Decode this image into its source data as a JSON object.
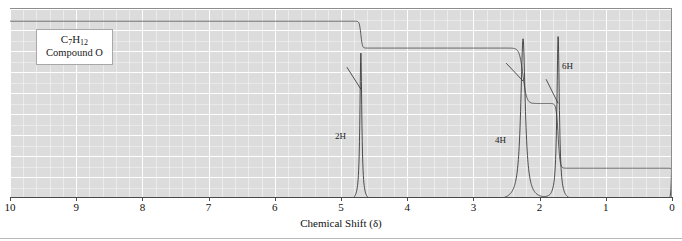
{
  "figure": {
    "type": "nmr-spectrum",
    "compound_label": {
      "formula_prefix": "C",
      "formula_sub1": "7",
      "formula_mid": "H",
      "formula_sub2": "12",
      "formula_plain": "C7H12",
      "name": "Compound O"
    },
    "axis": {
      "title": "Chemical Shift (δ)",
      "unit": "ppm",
      "ticks": [
        "10",
        "9",
        "8",
        "7",
        "6",
        "5",
        "4",
        "3",
        "2",
        "1",
        "0"
      ],
      "min_ppm": 0,
      "max_ppm": 10,
      "direction": "right-to-left",
      "minor_per_major": 5
    },
    "annotations": [
      {
        "label": "2H",
        "ppm": 4.7
      },
      {
        "label": "4H",
        "ppm": 2.25
      },
      {
        "label": "6H",
        "ppm": 1.72
      }
    ],
    "colors": {
      "plot_background": "#dcdcdc",
      "gridline": "#ffffff",
      "trace": "#3a3a3a",
      "axis": "#4a4a4a",
      "page_background": "#ffffff"
    }
  },
  "chart_data": {
    "type": "line",
    "title": "",
    "xlabel": "Chemical Shift (δ)",
    "ylabel": "",
    "xlim": [
      10,
      0
    ],
    "ylim": [
      0,
      1
    ],
    "grid": true,
    "legend": "none",
    "series": [
      {
        "name": "spectrum",
        "peaks": [
          {
            "ppm": 4.7,
            "height": 0.84,
            "width": 0.035,
            "label": "2H",
            "protons": 2
          },
          {
            "ppm": 2.25,
            "height": 0.92,
            "width": 0.085,
            "label": "4H",
            "protons": 4
          },
          {
            "ppm": 1.72,
            "height": 0.93,
            "width": 0.045,
            "label": "6H",
            "protons": 6
          },
          {
            "ppm": 0.0,
            "height": 0.3,
            "width": 0.018,
            "label": "TMS",
            "protons": 0
          }
        ]
      },
      {
        "name": "integration",
        "steps": [
          {
            "ppm": 10.0,
            "level": 0.055
          },
          {
            "ppm": 4.7,
            "level": 0.215
          },
          {
            "ppm": 2.25,
            "level": 0.545
          },
          {
            "ppm": 1.72,
            "level": 0.93
          },
          {
            "ppm": 0.0,
            "level": 0.975
          }
        ]
      }
    ]
  }
}
